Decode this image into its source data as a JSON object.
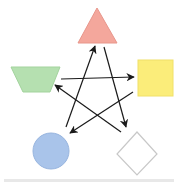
{
  "diagram": {
    "type": "pentagram-cycle",
    "nodes": [
      {
        "id": "triangle",
        "shape": "triangle",
        "fill": "#f4a79c",
        "stroke": "#e8968b",
        "position": "top"
      },
      {
        "id": "square",
        "shape": "square",
        "fill": "#fbed7a",
        "stroke": "#f0e068",
        "position": "right"
      },
      {
        "id": "diamond",
        "shape": "diamond",
        "fill": "#ffffff",
        "stroke": "#c8c8c8",
        "position": "bottom-right"
      },
      {
        "id": "circle",
        "shape": "circle",
        "fill": "#a9c4ea",
        "stroke": "#98b5df",
        "position": "bottom-left"
      },
      {
        "id": "trapezoid",
        "shape": "inverted-trapezoid",
        "fill": "#b5e0b0",
        "stroke": "#a3d39d",
        "position": "left"
      }
    ],
    "edges": [
      {
        "from": "circle",
        "to": "triangle"
      },
      {
        "from": "triangle",
        "to": "diamond"
      },
      {
        "from": "trapezoid",
        "to": "square"
      },
      {
        "from": "square",
        "to": "circle"
      },
      {
        "from": "diamond",
        "to": "trapezoid"
      }
    ],
    "arrow_color": "#1a1a1a"
  }
}
